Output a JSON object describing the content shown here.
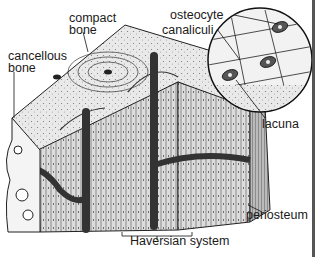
{
  "diagram": {
    "background": "#ffffff",
    "ink": "#1a1a1a",
    "labels": {
      "compact_bone_line1": "compact",
      "compact_bone_line2": "bone",
      "cancellous_bone_line1": "cancellous",
      "cancellous_bone_line2": "bone",
      "osteocyte": "osteocyte",
      "canaliculi": "canaliculi",
      "lacuna": "lacuna",
      "periosteum": "periosteum",
      "haversian_system": "Haversian system"
    },
    "regions": [
      "compact-bone-block",
      "cancellous-bone-edge",
      "haversian-canal-left",
      "haversian-canal-right",
      "magnified-inset-circle",
      "periosteum-layer"
    ]
  }
}
